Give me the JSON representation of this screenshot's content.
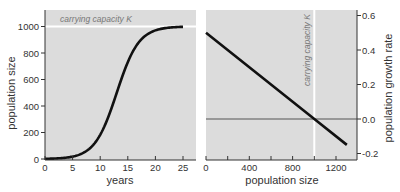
{
  "chart_data": [
    {
      "type": "line",
      "title": "",
      "xlabel": "years",
      "ylabel": "population size",
      "xlim": [
        0,
        27
      ],
      "ylim": [
        0,
        1130
      ],
      "xticks": [
        0,
        5,
        10,
        15,
        20,
        25
      ],
      "yticks": [
        0,
        200,
        400,
        600,
        800,
        1000
      ],
      "grid": false,
      "annotations": [
        {
          "text": "carrying capacity K",
          "y": 1000,
          "type": "hline"
        }
      ],
      "series": [
        {
          "name": "logistic growth",
          "x": [
            0,
            2,
            4,
            6,
            8,
            10,
            11,
            12,
            13,
            14,
            15,
            16,
            18,
            20,
            22,
            25
          ],
          "values": [
            2,
            4,
            11,
            29,
            76,
            182,
            269,
            378,
            500,
            622,
            731,
            818,
            924,
            971,
            989,
            998
          ]
        }
      ]
    },
    {
      "type": "line",
      "title": "",
      "xlabel": "population size",
      "ylabel": "population growth rate",
      "xlim": [
        0,
        1390
      ],
      "ylim": [
        -0.24,
        0.64
      ],
      "xticks": [
        0,
        400,
        800,
        1200
      ],
      "yticks": [
        -0.2,
        0.0,
        0.2,
        0.4,
        0.6
      ],
      "grid": false,
      "annotations": [
        {
          "text": "carrying capacity K",
          "x": 1000,
          "type": "vline"
        },
        {
          "text": "",
          "y": 0.0,
          "type": "hline"
        }
      ],
      "series": [
        {
          "name": "per-capita growth rate",
          "x": [
            0,
            1000,
            1300
          ],
          "values": [
            0.5,
            0.0,
            -0.15
          ]
        }
      ]
    }
  ],
  "left": {
    "xlabel": "years",
    "ylabel": "population size",
    "annotation": "carrying capacity K",
    "xticks": [
      "0",
      "5",
      "10",
      "15",
      "20",
      "25"
    ],
    "yticks": [
      "0",
      "200",
      "400",
      "600",
      "800",
      "1000"
    ]
  },
  "right": {
    "xlabel": "population size",
    "ylabel": "population growth rate",
    "annotation": "carrying capacity K",
    "xticks": [
      "0",
      "400",
      "800",
      "1200"
    ],
    "yticks": [
      "-0.2",
      "0.0",
      "0.2",
      "0.4",
      "0.6"
    ]
  },
  "colors": {
    "panel_bg": "#dcdcdc",
    "curve": "#111111",
    "capacity_line": "#ffffff",
    "zero_line": "#555555",
    "axis": "#333333"
  }
}
